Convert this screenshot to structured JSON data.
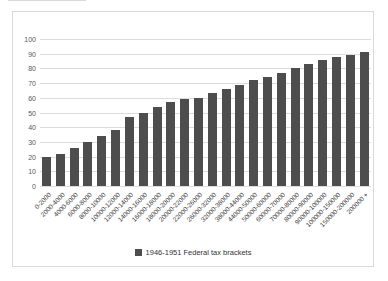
{
  "chart_data": {
    "type": "bar",
    "title": "",
    "xlabel": "",
    "ylabel": "",
    "categories": [
      "0-2000",
      "2000-4000",
      "4000-6000",
      "6000-8000",
      "8000-10000",
      "10000-12000",
      "12000-14000",
      "14000-16000",
      "16000-18000",
      "18000-20000",
      "20000-22000",
      "22000-26000",
      "26000-32000",
      "32000-38000",
      "38000-44000",
      "44000-50000",
      "50000-60000",
      "60000-70000",
      "70000-80000",
      "80000-90000",
      "90000-100000",
      "100000-150000",
      "150000-200000",
      "200000 +"
    ],
    "values": [
      20,
      22,
      26,
      30,
      34,
      38,
      47,
      50,
      54,
      57,
      59,
      60,
      63,
      66,
      69,
      72,
      74,
      77,
      80,
      83,
      86,
      88,
      89,
      91
    ],
    "series_name": "1946-1951 Federal tax brackets",
    "ylim": [
      0,
      100
    ],
    "y_ticks": [
      0,
      10,
      20,
      30,
      40,
      50,
      60,
      70,
      80,
      90,
      100
    ],
    "grid": "horizontal",
    "legend_position": "bottom",
    "bar_color": "#4d4d4d",
    "gridline_color": "#dcdcdc",
    "frame_border_color": "#d9d9d9",
    "axis_text_color": "#595959"
  },
  "legend": {
    "label": "1946-1951 Federal tax brackets"
  }
}
